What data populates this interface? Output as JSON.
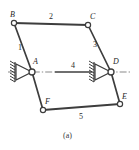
{
  "figure": {
    "caption": "(a)",
    "background_color": "#ffffff",
    "line_color": "#3d3d3d",
    "joint_fill": "#ffffff",
    "centerline_color": "#8a8a8a"
  },
  "joints": [
    {
      "id": "B",
      "label": "B",
      "x": 14,
      "y": 23,
      "label_x": 10,
      "label_y": 11
    },
    {
      "id": "C",
      "label": "C",
      "x": 88,
      "y": 25,
      "label_x": 90,
      "label_y": 13
    },
    {
      "id": "A",
      "label": "A",
      "x": 32,
      "y": 72,
      "label_x": 33,
      "label_y": 58
    },
    {
      "id": "D",
      "label": "D",
      "x": 111,
      "y": 72,
      "label_x": 113,
      "label_y": 58
    },
    {
      "id": "F",
      "label": "F",
      "x": 43,
      "y": 110,
      "label_x": 45,
      "label_y": 98
    },
    {
      "id": "E",
      "label": "E",
      "x": 120,
      "y": 104,
      "label_x": 122,
      "label_y": 93
    }
  ],
  "links": [
    {
      "number": "1",
      "from": "B",
      "to": "A",
      "label_x": 18,
      "label_y": 44
    },
    {
      "number": "2",
      "from": "B",
      "to": "C",
      "label_x": 49,
      "label_y": 13
    },
    {
      "number": "3",
      "from": "C",
      "to": "D",
      "label_x": 93,
      "label_y": 41
    },
    {
      "number": "4",
      "from": "A",
      "to": "D",
      "label_x": 71,
      "label_y": 62
    },
    {
      "number": "5",
      "from": "F",
      "to": "E",
      "label_x": 79,
      "label_y": 113
    }
  ],
  "supports": [
    {
      "at_joint": "A",
      "type": "pin-support",
      "orientation": "left",
      "hatching": true
    },
    {
      "at_joint": "D",
      "type": "pin-support",
      "orientation": "left",
      "hatching": true
    }
  ]
}
